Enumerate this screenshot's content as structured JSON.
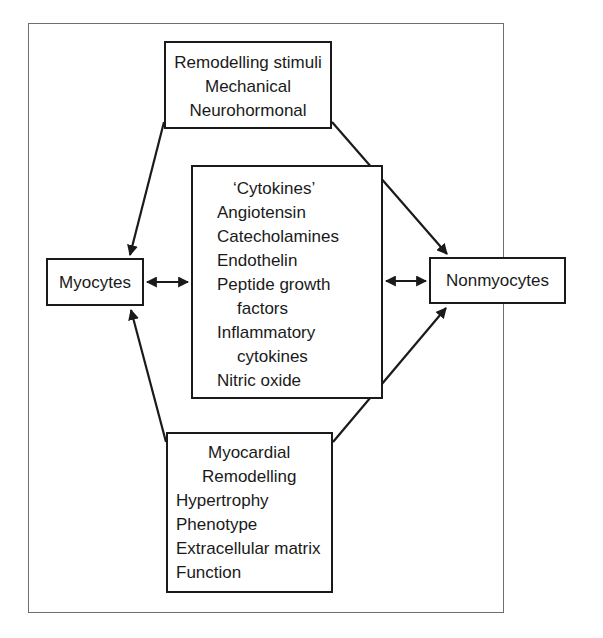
{
  "diagram": {
    "nodes": {
      "stimuli": {
        "lines": [
          "Remodelling stimuli",
          "Mechanical",
          "Neurohormonal"
        ]
      },
      "cytokines": {
        "lines": [
          "‘Cytokines’",
          "Angiotensin",
          "Catecholamines",
          "Endothelin",
          "Peptide growth",
          "factors",
          "Inflammatory",
          "cytokines",
          "Nitric oxide"
        ]
      },
      "myocytes": {
        "label": "Myocytes"
      },
      "nonmyocytes": {
        "label": "Nonmyocytes"
      },
      "remodelling": {
        "lines": [
          "Myocardial",
          "Remodelling",
          "Hypertrophy",
          "Phenotype",
          "Extracellular matrix",
          "Function"
        ]
      }
    },
    "edges": [
      {
        "from": "stimuli",
        "to": "myocytes",
        "type": "arrow"
      },
      {
        "from": "stimuli",
        "to": "nonmyocytes",
        "type": "arrow"
      },
      {
        "from": "myocytes",
        "to": "cytokines",
        "type": "bidirectional"
      },
      {
        "from": "cytokines",
        "to": "nonmyocytes",
        "type": "bidirectional"
      },
      {
        "from": "remodelling",
        "to": "myocytes",
        "type": "arrow"
      },
      {
        "from": "remodelling",
        "to": "nonmyocytes",
        "type": "arrow"
      }
    ],
    "colors": {
      "ink": "#1a1a1a",
      "frame": "#6e6e6e",
      "background": "#ffffff"
    }
  }
}
